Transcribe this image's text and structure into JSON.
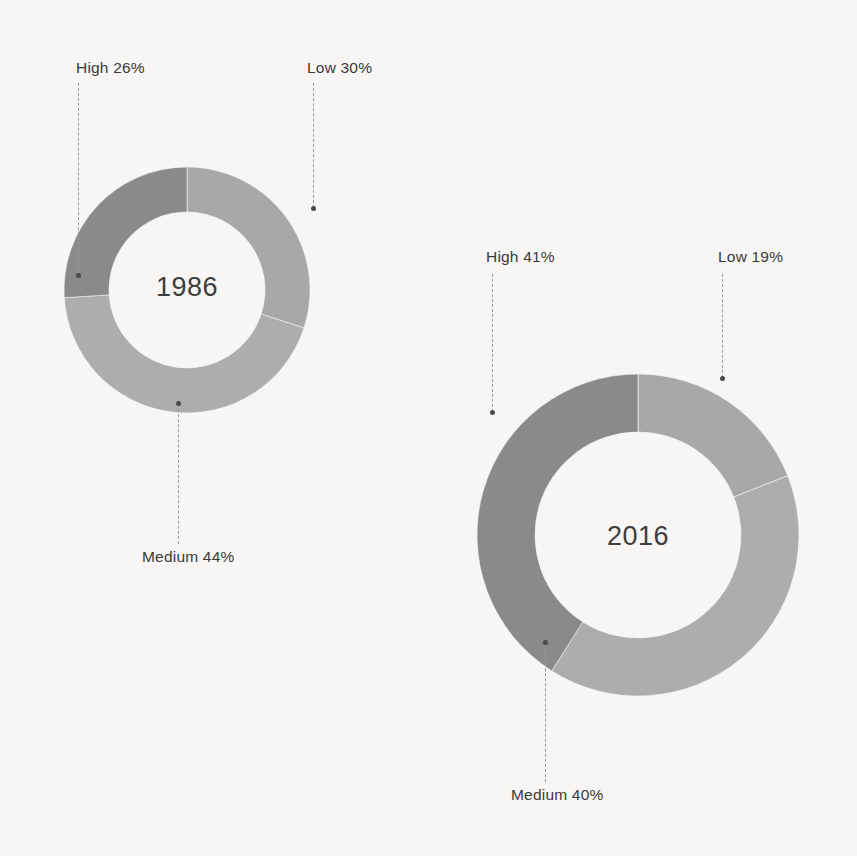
{
  "figure": {
    "background_color": "#f7f6f4",
    "text_color": "#3a3a3a",
    "leader_color": "#9a9a9a"
  },
  "chart_data": [
    {
      "type": "pie",
      "variant": "donut",
      "title": "1986",
      "center_label": "1986",
      "labels": [
        "Low",
        "Medium",
        "High"
      ],
      "values": [
        30,
        44,
        26
      ],
      "value_suffix": "%",
      "colors": [
        "#a8a8a8",
        "#adadad",
        "#8a8a8a"
      ],
      "start_angle_deg": 0,
      "direction": "clockwise",
      "annotations": [
        {
          "text": "Low 30%",
          "segment": "Low",
          "value": 30
        },
        {
          "text": "Medium 44%",
          "segment": "Medium",
          "value": 44
        },
        {
          "text": "High 26%",
          "segment": "High",
          "value": 26
        }
      ],
      "legend_position": "callout-labels",
      "grid": false
    },
    {
      "type": "pie",
      "variant": "donut",
      "title": "2016",
      "center_label": "2016",
      "labels": [
        "Low",
        "Medium",
        "High"
      ],
      "values": [
        19,
        40,
        41
      ],
      "value_suffix": "%",
      "colors": [
        "#a8a8a8",
        "#adadad",
        "#8a8a8a"
      ],
      "start_angle_deg": 0,
      "direction": "clockwise",
      "annotations": [
        {
          "text": "Low 19%",
          "segment": "Low",
          "value": 19
        },
        {
          "text": "Medium 40%",
          "segment": "Medium",
          "value": 40
        },
        {
          "text": "High 41%",
          "segment": "High",
          "value": 41
        }
      ],
      "legend_position": "callout-labels",
      "grid": false
    }
  ],
  "charts": {
    "chart1986": {
      "year": "1986",
      "callouts": {
        "high": "High 26%",
        "low": "Low 30%",
        "medium": "Medium 44%"
      }
    },
    "chart2016": {
      "year": "2016",
      "callouts": {
        "high": "High 41%",
        "low": "Low 19%",
        "medium": "Medium 40%"
      }
    }
  }
}
